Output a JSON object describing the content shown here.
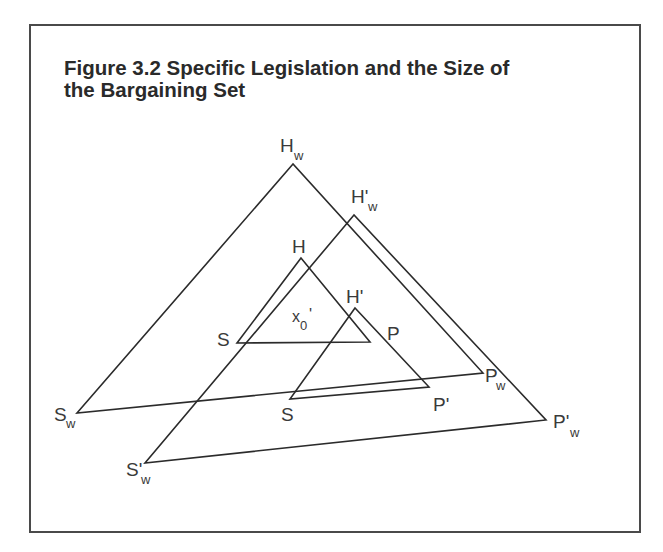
{
  "figure": {
    "title_line1": "Figure 3.2 Specific Legislation and the Size of",
    "title_line2": "the Bargaining Set",
    "title_full": "Figure 3.2 Specific Legislation and the Size of the Bargaining Set"
  },
  "triangles": {
    "outer_original": {
      "points": "293,164 77,413 483,373",
      "labels": {
        "apex": "H",
        "apex_sub": "w",
        "left": "S",
        "left_sub": "w",
        "right": "P",
        "right_sub": "w"
      }
    },
    "outer_shifted": {
      "points": "354,215 145,463 546,420",
      "labels": {
        "apex": "H'",
        "apex_sub": "w",
        "left": "S'",
        "left_sub": "w",
        "right": "P'",
        "right_sub": "w"
      }
    },
    "inner_original": {
      "points": "301,258 237,343 370,342",
      "labels": {
        "apex": "H",
        "left": "S",
        "right": "P"
      }
    },
    "inner_shifted": {
      "points": "355,308 290,399 429,387",
      "labels": {
        "apex": "H'",
        "left": "S",
        "right": "P'"
      }
    }
  },
  "point_label": {
    "main": "x",
    "sub": "0",
    "prime": "'"
  },
  "colors": {
    "line": "#2b2b2b",
    "text": "#2a2a2a",
    "border": "#4a4a4a"
  }
}
